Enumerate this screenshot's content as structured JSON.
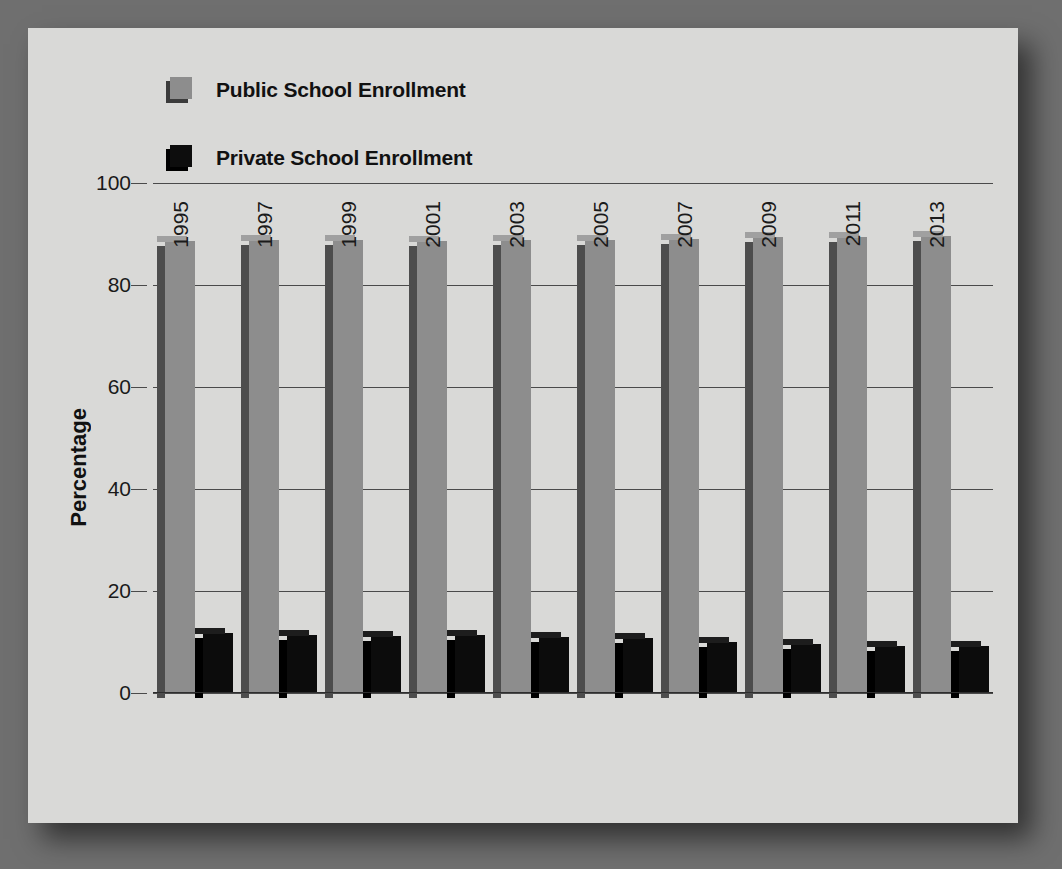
{
  "chart_data": {
    "type": "bar",
    "title": "",
    "xlabel": "",
    "ylabel": "Percentage",
    "ylim": [
      0,
      100
    ],
    "yticks": [
      0,
      20,
      40,
      60,
      80,
      100
    ],
    "grid": true,
    "legend_position": "top-left",
    "categories": [
      "1995",
      "1997",
      "1999",
      "2001",
      "2003",
      "2005",
      "2007",
      "2009",
      "2011",
      "2013"
    ],
    "series": [
      {
        "name": "Public School Enrollment",
        "color": "#8d8d8d",
        "values": [
          88.7,
          88.8,
          88.8,
          88.6,
          88.8,
          88.9,
          89.0,
          89.4,
          89.5,
          89.6
        ]
      },
      {
        "name": "Private School Enrollment",
        "color": "#0c0c0c",
        "values": [
          11.8,
          11.3,
          11.2,
          11.3,
          11.0,
          10.7,
          10.1,
          9.7,
          9.3,
          9.2
        ]
      }
    ]
  },
  "legend": {
    "items": [
      {
        "label": "Public School Enrollment",
        "swatch": "public-swatch-icon"
      },
      {
        "label": "Private School Enrollment",
        "swatch": "private-swatch-icon"
      }
    ]
  },
  "axes": {
    "y_title": "Percentage",
    "y_ticks": [
      "0",
      "20",
      "40",
      "60",
      "80",
      "100"
    ],
    "x_ticks": [
      "1995",
      "1997",
      "1999",
      "2001",
      "2003",
      "2005",
      "2007",
      "2009",
      "2011",
      "2013"
    ]
  },
  "colors": {
    "page_background": "#6f6f6f",
    "panel_background": "#d9d9d7",
    "public_bar": "#8d8d8d",
    "public_bar_side": "#4d4d4d",
    "private_bar": "#0c0c0c",
    "gridline": "#4a4a4a",
    "text": "#111111"
  }
}
